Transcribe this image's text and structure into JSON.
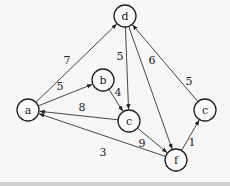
{
  "graph": {
    "directed": true,
    "nodes": [
      {
        "id": "a",
        "label": "a"
      },
      {
        "id": "b",
        "label": "b"
      },
      {
        "id": "d",
        "label": "d"
      },
      {
        "id": "c1",
        "label": "c"
      },
      {
        "id": "c2",
        "label": "c"
      },
      {
        "id": "f",
        "label": "f"
      }
    ],
    "edges": [
      {
        "from": "a",
        "to": "d",
        "weight": "7"
      },
      {
        "from": "a",
        "to": "b",
        "weight": "5"
      },
      {
        "from": "b",
        "to": "c1",
        "weight": "4"
      },
      {
        "from": "d",
        "to": "c1",
        "weight": "5"
      },
      {
        "from": "d",
        "to": "f",
        "weight": "6"
      },
      {
        "from": "c1",
        "to": "a",
        "weight": "8"
      },
      {
        "from": "c1",
        "to": "f",
        "weight": "9"
      },
      {
        "from": "f",
        "to": "a",
        "weight": "3"
      },
      {
        "from": "f",
        "to": "c2",
        "weight": "1"
      },
      {
        "from": "c2",
        "to": "d",
        "weight": "5"
      }
    ]
  }
}
